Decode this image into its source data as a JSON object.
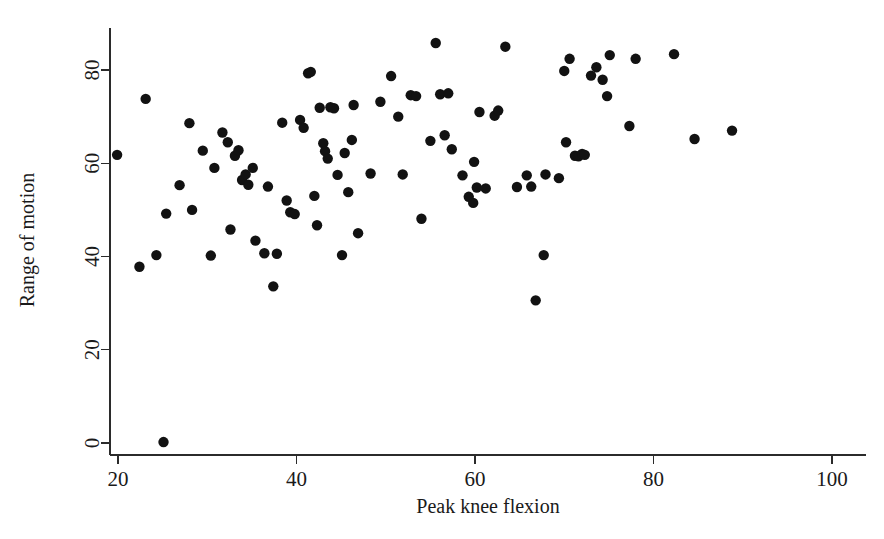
{
  "chart_data": {
    "type": "scatter",
    "title": "",
    "xlabel": "Peak knee flexion",
    "ylabel": "Range of motion",
    "xlim": [
      15,
      104
    ],
    "ylim": [
      -6,
      91
    ],
    "xticks": [
      20,
      40,
      60,
      80,
      100
    ],
    "xticklabels": [
      "20",
      "40",
      "60",
      "80",
      "100"
    ],
    "yticks": [
      0,
      20,
      40,
      60,
      80
    ],
    "yticklabels": [
      "0",
      "20",
      "40",
      "60",
      "80"
    ],
    "grid": false,
    "legend": null,
    "marker": "filled-circle",
    "marker_color": "#121212",
    "marker_size_px": 5.2,
    "n_points": 97,
    "points": [
      [
        19.9,
        61.8
      ],
      [
        22.4,
        37.8
      ],
      [
        23.1,
        73.8
      ],
      [
        24.3,
        40.3
      ],
      [
        25.1,
        0.2
      ],
      [
        25.4,
        49.2
      ],
      [
        26.9,
        55.3
      ],
      [
        28.0,
        68.6
      ],
      [
        28.3,
        50.0
      ],
      [
        29.5,
        62.7
      ],
      [
        30.4,
        40.2
      ],
      [
        30.8,
        59.0
      ],
      [
        31.7,
        66.6
      ],
      [
        32.3,
        64.5
      ],
      [
        32.6,
        45.8
      ],
      [
        33.1,
        61.6
      ],
      [
        33.5,
        62.8
      ],
      [
        33.9,
        56.4
      ],
      [
        34.3,
        57.6
      ],
      [
        34.6,
        55.4
      ],
      [
        35.1,
        59.0
      ],
      [
        35.4,
        43.4
      ],
      [
        36.4,
        40.7
      ],
      [
        36.8,
        55.0
      ],
      [
        37.4,
        33.6
      ],
      [
        37.8,
        40.6
      ],
      [
        38.4,
        68.7
      ],
      [
        38.9,
        52.0
      ],
      [
        39.3,
        49.5
      ],
      [
        39.8,
        49.1
      ],
      [
        40.4,
        69.3
      ],
      [
        40.8,
        67.6
      ],
      [
        41.3,
        79.3
      ],
      [
        41.6,
        79.6
      ],
      [
        42.0,
        53.0
      ],
      [
        42.3,
        46.7
      ],
      [
        42.6,
        71.9
      ],
      [
        43.0,
        64.3
      ],
      [
        43.2,
        62.6
      ],
      [
        43.5,
        61.0
      ],
      [
        43.8,
        72.0
      ],
      [
        44.2,
        71.8
      ],
      [
        44.6,
        57.5
      ],
      [
        45.1,
        40.3
      ],
      [
        45.4,
        62.2
      ],
      [
        45.8,
        53.8
      ],
      [
        46.4,
        72.5
      ],
      [
        46.9,
        45.0
      ],
      [
        48.3,
        57.8
      ],
      [
        49.4,
        73.2
      ],
      [
        50.6,
        78.7
      ],
      [
        51.4,
        70.0
      ],
      [
        51.9,
        57.6
      ],
      [
        52.8,
        74.6
      ],
      [
        53.4,
        74.4
      ],
      [
        54.0,
        48.1
      ],
      [
        55.0,
        64.8
      ],
      [
        55.6,
        85.8
      ],
      [
        56.1,
        74.8
      ],
      [
        56.6,
        66.0
      ],
      [
        57.4,
        63.0
      ],
      [
        58.6,
        57.4
      ],
      [
        59.3,
        52.8
      ],
      [
        59.8,
        51.5
      ],
      [
        59.9,
        60.3
      ],
      [
        60.2,
        54.8
      ],
      [
        60.5,
        71.0
      ],
      [
        61.2,
        54.6
      ],
      [
        62.2,
        70.2
      ],
      [
        62.6,
        71.3
      ],
      [
        63.4,
        85.0
      ],
      [
        64.7,
        54.9
      ],
      [
        65.8,
        57.4
      ],
      [
        66.8,
        30.6
      ],
      [
        67.7,
        40.3
      ],
      [
        67.9,
        57.6
      ],
      [
        69.4,
        56.8
      ],
      [
        70.0,
        79.8
      ],
      [
        70.2,
        64.5
      ],
      [
        70.6,
        82.4
      ],
      [
        71.2,
        61.6
      ],
      [
        71.6,
        61.5
      ],
      [
        72.0,
        62.0
      ],
      [
        72.3,
        61.8
      ],
      [
        73.0,
        78.8
      ],
      [
        73.6,
        80.6
      ],
      [
        74.3,
        77.9
      ],
      [
        74.8,
        74.4
      ],
      [
        75.1,
        83.2
      ],
      [
        77.3,
        68.0
      ],
      [
        78.0,
        82.4
      ],
      [
        82.3,
        83.4
      ],
      [
        84.6,
        65.2
      ],
      [
        88.8,
        67.0
      ],
      [
        46.2,
        65.0
      ],
      [
        57.0,
        75.0
      ],
      [
        66.3,
        55.0
      ]
    ]
  }
}
